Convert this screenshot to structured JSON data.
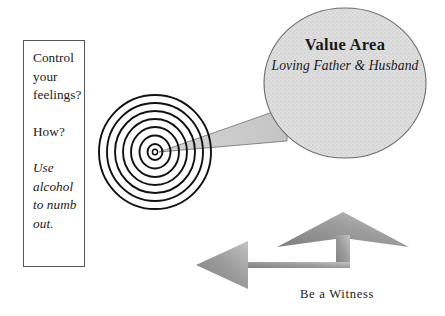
{
  "canvas": {
    "width": 445,
    "height": 316,
    "background": "#ffffff"
  },
  "colors": {
    "ink": "#1a1a1a",
    "box_border": "#555555",
    "bubble_fill": "#dcdcdc",
    "bubble_border": "#6b6b6b",
    "tail_fill": "#c9c9c9",
    "arrow_light": "#b4b4b4",
    "arrow_dark": "#8a8a8a",
    "spiral_stroke": "#111111"
  },
  "left_box": {
    "name": "control-feelings-box",
    "lines": [
      "Control",
      "your",
      "feelings?"
    ],
    "question": "How?",
    "answer_lines": [
      "Use",
      "alcohol",
      "to numb",
      "out."
    ]
  },
  "spiral": {
    "name": "concentric-spiral",
    "center_x": 155,
    "center_y": 152,
    "rings": 7,
    "outer_radius_x": 56,
    "outer_radius_y": 57
  },
  "bubble": {
    "name": "value-area-callout",
    "title": "Value Area",
    "subtitle": "Loving Father & Husband",
    "center_x": 345,
    "center_y": 83,
    "radius_x": 81,
    "radius_y": 75
  },
  "arrow": {
    "name": "be-a-witness-arrow",
    "caption": "Be a Witness",
    "directions": [
      "left",
      "up"
    ]
  }
}
